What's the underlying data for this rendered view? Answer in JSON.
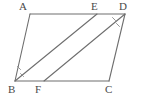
{
  "figure": {
    "type": "geometry-diagram",
    "shape": "parallelogram",
    "background_color": "#ffffff",
    "stroke_color": "#6e6e6e",
    "label_color": "#4a4a4a",
    "tick_color": "#8a8a8a",
    "canvas": {
      "width": 141,
      "height": 110
    },
    "vertices": [
      {
        "id": "A",
        "label": "A",
        "x": 30,
        "y": 14,
        "label_x": 19,
        "label_y": 1
      },
      {
        "id": "E",
        "label": "E",
        "x": 97,
        "y": 14,
        "label_x": 91,
        "label_y": 1
      },
      {
        "id": "D",
        "label": "D",
        "x": 125,
        "y": 14,
        "label_x": 119,
        "label_y": 1
      },
      {
        "id": "B",
        "label": "B",
        "x": 15,
        "y": 81,
        "label_x": 8,
        "label_y": 84
      },
      {
        "id": "F",
        "label": "F",
        "x": 44,
        "y": 81,
        "label_x": 35,
        "label_y": 84
      },
      {
        "id": "C",
        "label": "C",
        "x": 109,
        "y": 81,
        "label_x": 105,
        "label_y": 84
      }
    ],
    "edges": [
      {
        "name": "edge-AD",
        "from": "A",
        "to": "D",
        "points": "30,14 125,14"
      },
      {
        "name": "edge-AB",
        "from": "A",
        "to": "B",
        "points": "30,14 15,81"
      },
      {
        "name": "edge-BC",
        "from": "B",
        "to": "C",
        "points": "15,81 109,81"
      },
      {
        "name": "edge-DC",
        "from": "D",
        "to": "C",
        "points": "125,14 109,81"
      }
    ],
    "diagonals": [
      {
        "name": "segment-BE",
        "from": "B",
        "to": "E",
        "points": "15,81 97,14"
      },
      {
        "name": "segment-FD",
        "from": "F",
        "to": "D",
        "points": "44,81 125,14"
      }
    ],
    "angle_ticks": [
      {
        "name": "angle-tick-B-upper",
        "points": "17.5,66.5 20.5,69.5"
      },
      {
        "name": "angle-tick-B-lower",
        "points": "20.5,73.5 23.5,76.5"
      },
      {
        "name": "angle-tick-D-upper",
        "points": "112.5,17.5 115.5,20.5"
      },
      {
        "name": "angle-tick-D-lower",
        "points": "116.5,23.5 119.5,26.5"
      }
    ]
  }
}
